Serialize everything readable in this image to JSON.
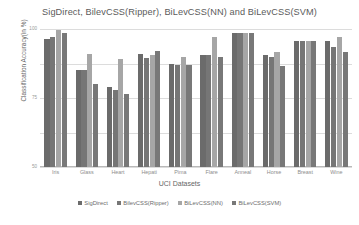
{
  "chart_data": {
    "type": "bar",
    "title": "SigDirect, BilevCSS(Ripper), BiLevCSS(NN) and BiLevCSS(SVM)",
    "xlabel": "UCI Datasets",
    "ylabel": "Classification Accuracy(in %)",
    "categories": [
      "Iris",
      "Glass",
      "Heart",
      "Hepati",
      "Pima",
      "Flare",
      "Anneal",
      "Horse",
      "Breast",
      "Wine"
    ],
    "ylim": [
      0,
      100
    ],
    "yticks": [
      0,
      25,
      50,
      75,
      100
    ],
    "ytick_labels": [
      "0",
      "25",
      "50",
      "75",
      "100"
    ],
    "grid": true,
    "legend_position": "bottom",
    "series": [
      {
        "name": "SigDirect",
        "color": "#6b6b6b",
        "values": [
          93,
          70,
          58,
          82,
          75,
          81,
          97,
          81,
          91,
          91
        ]
      },
      {
        "name": "BilevCSS(Ripper)",
        "color": "#767676",
        "values": [
          94,
          70,
          56,
          79,
          74,
          81,
          97,
          80,
          91,
          87
        ]
      },
      {
        "name": "BiLevCSS(NN)",
        "color": "#a6a6a6",
        "values": [
          99,
          82,
          78,
          81,
          80,
          94,
          97,
          83,
          91,
          94
        ]
      },
      {
        "name": "BiLevCSS(SVM)",
        "color": "#787878",
        "values": [
          97,
          60,
          53,
          84,
          74,
          80,
          97,
          73,
          91,
          83
        ]
      }
    ]
  }
}
